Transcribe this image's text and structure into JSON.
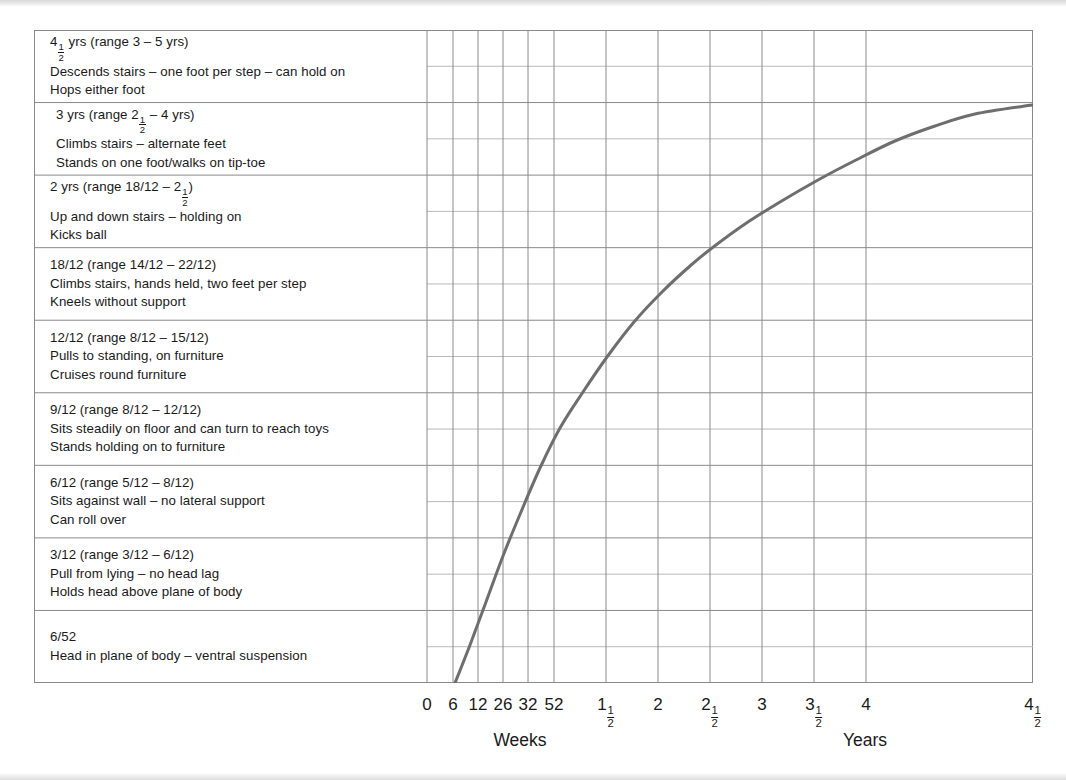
{
  "chart_data": {
    "type": "line",
    "title": "",
    "xlabel_left": "Weeks",
    "xlabel_right": "Years",
    "ylabel": "",
    "grid": true,
    "legend": "none",
    "axis_ticks": [
      {
        "label": "0",
        "whole": "0",
        "frac_num": "",
        "frac_den": "",
        "unit": "weeks",
        "x": 427
      },
      {
        "label": "6",
        "whole": "6",
        "frac_num": "",
        "frac_den": "",
        "unit": "weeks",
        "x": 453
      },
      {
        "label": "12",
        "whole": "12",
        "frac_num": "",
        "frac_den": "",
        "unit": "weeks",
        "x": 478
      },
      {
        "label": "26",
        "whole": "26",
        "frac_num": "",
        "frac_den": "",
        "unit": "weeks",
        "x": 503
      },
      {
        "label": "32",
        "whole": "32",
        "frac_num": "",
        "frac_den": "",
        "unit": "weeks",
        "x": 528
      },
      {
        "label": "52",
        "whole": "52",
        "frac_num": "",
        "frac_den": "",
        "unit": "weeks",
        "x": 554
      },
      {
        "label": "1 1/2",
        "whole": "1",
        "frac_num": "1",
        "frac_den": "2",
        "unit": "years",
        "x": 606
      },
      {
        "label": "2",
        "whole": "2",
        "frac_num": "",
        "frac_den": "",
        "unit": "years",
        "x": 658
      },
      {
        "label": "2 1/2",
        "whole": "2",
        "frac_num": "1",
        "frac_den": "2",
        "unit": "years",
        "x": 710
      },
      {
        "label": "3",
        "whole": "3",
        "frac_num": "",
        "frac_den": "",
        "unit": "years",
        "x": 762
      },
      {
        "label": "3 1/2",
        "whole": "3",
        "frac_num": "1",
        "frac_den": "2",
        "unit": "years",
        "x": 814
      },
      {
        "label": "4",
        "whole": "4",
        "frac_num": "",
        "frac_den": "",
        "unit": "years",
        "x": 866
      },
      {
        "label": "4 1/2",
        "whole": "4",
        "frac_num": "1",
        "frac_den": "2",
        "unit": "years",
        "x": 1033
      }
    ],
    "xlabel_left_x": 520,
    "xlabel_right_x": 865,
    "curve_color": "#6e6e6e",
    "curve_points": [
      {
        "x": 455,
        "y": 683
      },
      {
        "x": 470,
        "y": 645
      },
      {
        "x": 486,
        "y": 602
      },
      {
        "x": 503,
        "y": 556
      },
      {
        "x": 521,
        "y": 512
      },
      {
        "x": 540,
        "y": 468
      },
      {
        "x": 560,
        "y": 428
      },
      {
        "x": 583,
        "y": 392
      },
      {
        "x": 607,
        "y": 357
      },
      {
        "x": 634,
        "y": 322
      },
      {
        "x": 662,
        "y": 292
      },
      {
        "x": 690,
        "y": 266
      },
      {
        "x": 712,
        "y": 248
      },
      {
        "x": 745,
        "y": 224
      },
      {
        "x": 780,
        "y": 202
      },
      {
        "x": 818,
        "y": 180
      },
      {
        "x": 856,
        "y": 160
      },
      {
        "x": 895,
        "y": 141
      },
      {
        "x": 935,
        "y": 126
      },
      {
        "x": 975,
        "y": 114
      },
      {
        "x": 1032,
        "y": 105
      }
    ]
  },
  "panel": {
    "rows": [
      {
        "id": "row-4-5-yrs",
        "lines": [
          {
            "pre": "4",
            "frac_num": "1",
            "frac_den": "2",
            "post": " yrs (range 3 – 5 yrs)",
            "indent": false
          },
          {
            "pre": "Descends stairs – one foot per step – can hold on",
            "frac_num": "",
            "frac_den": "",
            "post": "",
            "indent": false
          },
          {
            "pre": "Hops either foot",
            "frac_num": "",
            "frac_den": "",
            "post": "",
            "indent": false
          }
        ]
      },
      {
        "id": "row-3-yrs",
        "lines": [
          {
            "pre": "3 yrs (range 2",
            "frac_num": "1",
            "frac_den": "2",
            "post": " – 4 yrs)",
            "indent": true
          },
          {
            "pre": "Climbs stairs – alternate feet",
            "frac_num": "",
            "frac_den": "",
            "post": "",
            "indent": true
          },
          {
            "pre": "Stands on one foot/walks on tip-toe",
            "frac_num": "",
            "frac_den": "",
            "post": "",
            "indent": true
          }
        ]
      },
      {
        "id": "row-2-yrs",
        "lines": [
          {
            "pre": "2 yrs (range 18/12 – 2",
            "frac_num": "1",
            "frac_den": "2",
            "post": ")",
            "indent": false
          },
          {
            "pre": "Up and down stairs – holding on",
            "frac_num": "",
            "frac_den": "",
            "post": "",
            "indent": false
          },
          {
            "pre": "Kicks ball",
            "frac_num": "",
            "frac_den": "",
            "post": "",
            "indent": false
          }
        ]
      },
      {
        "id": "row-18-12",
        "lines": [
          {
            "pre": "18/12 (range 14/12 – 22/12)",
            "frac_num": "",
            "frac_den": "",
            "post": "",
            "indent": false
          },
          {
            "pre": "Climbs stairs, hands held, two feet per step",
            "frac_num": "",
            "frac_den": "",
            "post": "",
            "indent": false
          },
          {
            "pre": "Kneels without support",
            "frac_num": "",
            "frac_den": "",
            "post": "",
            "indent": false
          }
        ]
      },
      {
        "id": "row-12-12",
        "lines": [
          {
            "pre": "12/12 (range 8/12 – 15/12)",
            "frac_num": "",
            "frac_den": "",
            "post": "",
            "indent": false
          },
          {
            "pre": "Pulls to standing, on furniture",
            "frac_num": "",
            "frac_den": "",
            "post": "",
            "indent": false
          },
          {
            "pre": "Cruises round furniture",
            "frac_num": "",
            "frac_den": "",
            "post": "",
            "indent": false
          }
        ]
      },
      {
        "id": "row-9-12",
        "lines": [
          {
            "pre": "9/12 (range 8/12 – 12/12)",
            "frac_num": "",
            "frac_den": "",
            "post": "",
            "indent": false
          },
          {
            "pre": "Sits steadily on floor and can turn to reach toys",
            "frac_num": "",
            "frac_den": "",
            "post": "",
            "indent": false
          },
          {
            "pre": "Stands holding on to furniture",
            "frac_num": "",
            "frac_den": "",
            "post": "",
            "indent": false
          }
        ]
      },
      {
        "id": "row-6-12",
        "lines": [
          {
            "pre": "6/12 (range 5/12 – 8/12)",
            "frac_num": "",
            "frac_den": "",
            "post": "",
            "indent": false
          },
          {
            "pre": "Sits against wall – no lateral support",
            "frac_num": "",
            "frac_den": "",
            "post": "",
            "indent": false
          },
          {
            "pre": "Can roll over",
            "frac_num": "",
            "frac_den": "",
            "post": "",
            "indent": false
          }
        ]
      },
      {
        "id": "row-3-12",
        "lines": [
          {
            "pre": "3/12 (range 3/12 – 6/12)",
            "frac_num": "",
            "frac_den": "",
            "post": "",
            "indent": false
          },
          {
            "pre": "Pull from lying – no head lag",
            "frac_num": "",
            "frac_den": "",
            "post": "",
            "indent": false
          },
          {
            "pre": "Holds head above plane of body",
            "frac_num": "",
            "frac_den": "",
            "post": "",
            "indent": false
          }
        ]
      },
      {
        "id": "row-6-52",
        "lines": [
          {
            "pre": "6/52",
            "frac_num": "",
            "frac_den": "",
            "post": "",
            "indent": false
          },
          {
            "pre": "Head in plane of body – ventral suspension",
            "frac_num": "",
            "frac_den": "",
            "post": "",
            "indent": false
          }
        ]
      }
    ]
  },
  "colors": {
    "curve": "#6e6e6e",
    "grid_major": "#8a8a8a",
    "grid_minor": "#b9b9b9",
    "text": "#1a1a1a"
  }
}
